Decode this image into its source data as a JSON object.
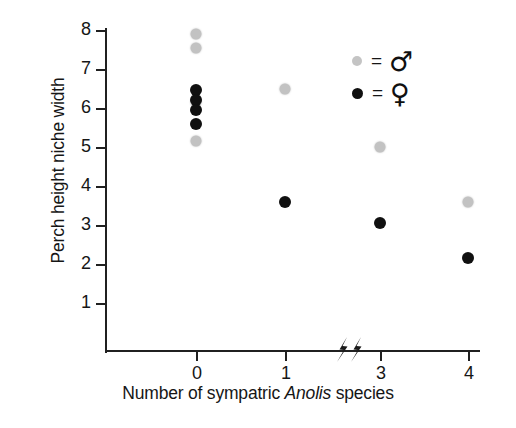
{
  "chart_data": {
    "type": "scatter",
    "title": "",
    "xlabel_parts": {
      "before": "Number of sympatric ",
      "italic": "Anolis",
      "after": " species"
    },
    "xlabel": "Number of sympatric Anolis species",
    "ylabel": "Perch height niche width",
    "xtick_labels": [
      "0",
      "1",
      "3",
      "4"
    ],
    "xtick_values": [
      0,
      1,
      3,
      4
    ],
    "ytick_labels": [
      "8",
      "7",
      "6",
      "5",
      "4",
      "3",
      "2",
      "1"
    ],
    "ytick_values": [
      8,
      7,
      6,
      5,
      4,
      3,
      2,
      1
    ],
    "ylim": [
      0.5,
      8.3
    ],
    "grid": false,
    "axis_break": {
      "present": true,
      "between": [
        1,
        3
      ],
      "glyph": "zigzag-double-slash"
    },
    "legend": {
      "position": "top-right",
      "entries": [
        {
          "name": "male",
          "symbol": "♂",
          "equals": "=",
          "color": "#c4c4c4",
          "marker": "filled-circle"
        },
        {
          "name": "female",
          "symbol": "♀",
          "equals": "=",
          "color": "#101010",
          "marker": "filled-circle"
        }
      ]
    },
    "series": [
      {
        "name": "male",
        "symbol": "♂",
        "color": "#c2c2c2",
        "points": [
          {
            "x": 0,
            "y": 7.9
          },
          {
            "x": 0,
            "y": 7.55
          },
          {
            "x": 0,
            "y": 6.15
          },
          {
            "x": 0,
            "y": 5.15
          },
          {
            "x": 1,
            "y": 6.5
          },
          {
            "x": 3,
            "y": 5.0
          },
          {
            "x": 4,
            "y": 3.6
          }
        ]
      },
      {
        "name": "female",
        "symbol": "♀",
        "color": "#101010",
        "points": [
          {
            "x": 0,
            "y": 6.45
          },
          {
            "x": 0,
            "y": 6.2
          },
          {
            "x": 0,
            "y": 5.95
          },
          {
            "x": 0,
            "y": 5.6
          },
          {
            "x": 1,
            "y": 3.6
          },
          {
            "x": 3,
            "y": 3.05
          },
          {
            "x": 4,
            "y": 2.15
          }
        ]
      }
    ]
  }
}
